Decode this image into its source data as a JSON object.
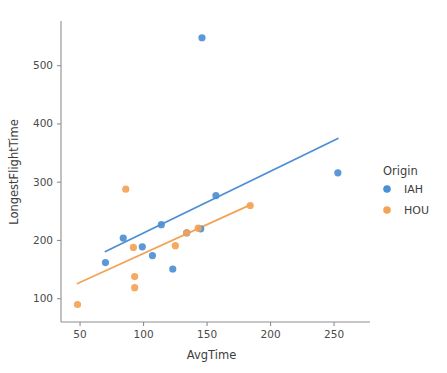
{
  "chart_data": {
    "type": "scatter",
    "title": "",
    "xlabel": "AvgTime",
    "ylabel": "LongestFlightTime",
    "xlim": [
      35,
      272
    ],
    "ylim": [
      60,
      575
    ],
    "xticks": [
      50,
      100,
      150,
      200,
      250
    ],
    "yticks": [
      100,
      200,
      300,
      400,
      500
    ],
    "xtick_labels": [
      "50",
      "100",
      "150",
      "200",
      "250"
    ],
    "ytick_labels": [
      "100",
      "200",
      "300",
      "400",
      "500"
    ],
    "grid": false,
    "legend": {
      "title": "Origin",
      "position": "right",
      "entries": [
        {
          "label": "IAH",
          "color": "#4c8fd4"
        },
        {
          "label": "HOU",
          "color": "#f3a355"
        }
      ]
    },
    "series": [
      {
        "name": "IAH",
        "color": "#4c8fd4",
        "marker": "circle",
        "points": [
          {
            "x": 70,
            "y": 162
          },
          {
            "x": 84,
            "y": 204
          },
          {
            "x": 99,
            "y": 189
          },
          {
            "x": 107,
            "y": 174
          },
          {
            "x": 114,
            "y": 227
          },
          {
            "x": 123,
            "y": 151
          },
          {
            "x": 134,
            "y": 213
          },
          {
            "x": 145,
            "y": 220
          },
          {
            "x": 146,
            "y": 548
          },
          {
            "x": 157,
            "y": 277
          },
          {
            "x": 253,
            "y": 316
          }
        ],
        "trendline": {
          "x0": 70,
          "y0": 181,
          "x1": 253,
          "y1": 375
        }
      },
      {
        "name": "HOU",
        "color": "#f3a355",
        "marker": "circle",
        "points": [
          {
            "x": 48,
            "y": 90
          },
          {
            "x": 86,
            "y": 288
          },
          {
            "x": 92,
            "y": 188
          },
          {
            "x": 93,
            "y": 138
          },
          {
            "x": 93,
            "y": 119
          },
          {
            "x": 125,
            "y": 191
          },
          {
            "x": 134,
            "y": 213
          },
          {
            "x": 143,
            "y": 221
          },
          {
            "x": 184,
            "y": 260
          }
        ],
        "trendline": {
          "x0": 48,
          "y0": 126,
          "x1": 184,
          "y1": 261
        }
      }
    ]
  }
}
